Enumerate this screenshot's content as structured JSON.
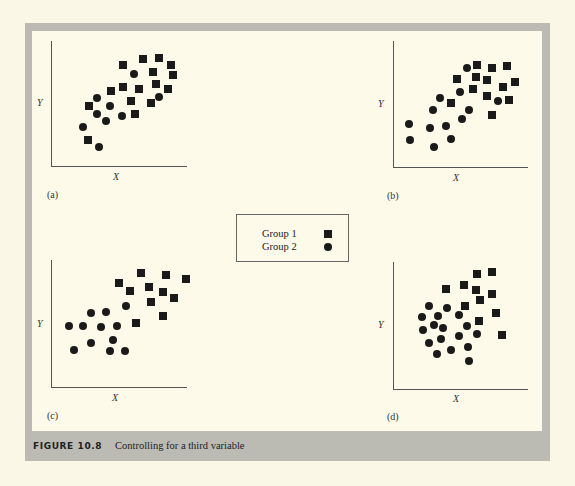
{
  "figure": {
    "label": "FIGURE 10.8",
    "caption": "Controlling for a third variable"
  },
  "legend": {
    "items": [
      {
        "label": "Group 1",
        "marker": "square"
      },
      {
        "label": "Group 2",
        "marker": "circle"
      }
    ]
  },
  "chart_data": [
    {
      "type": "scatter",
      "panel": "(a)",
      "xlabel": "X",
      "ylabel": "Y",
      "series": [
        {
          "name": "Group 1",
          "marker": "square",
          "points": [
            [
              123,
              65
            ],
            [
              143,
              59
            ],
            [
              159,
              58
            ],
            [
              171,
              65
            ],
            [
              153,
              72
            ],
            [
              173,
              75
            ],
            [
              111,
              91
            ],
            [
              123,
              87
            ],
            [
              139,
              89
            ],
            [
              156,
              84
            ],
            [
              168,
              89
            ],
            [
              89,
              106
            ],
            [
              131,
              101
            ],
            [
              151,
              103
            ],
            [
              135,
              114
            ],
            [
              88,
              140
            ]
          ]
        },
        {
          "name": "Group 2",
          "marker": "circle",
          "points": [
            [
              134,
              74
            ],
            [
              97,
              98
            ],
            [
              110,
              106
            ],
            [
              159,
              97
            ],
            [
              97,
              114
            ],
            [
              106,
              121
            ],
            [
              122,
              116
            ],
            [
              83,
              127
            ],
            [
              99,
              147
            ]
          ]
        }
      ]
    },
    {
      "type": "scatter",
      "panel": "(b)",
      "xlabel": "X",
      "ylabel": "Y",
      "series": [
        {
          "name": "Group 1",
          "marker": "square",
          "points": [
            [
              477,
              65
            ],
            [
              492,
              68
            ],
            [
              507,
              66
            ],
            [
              457,
              79
            ],
            [
              476,
              77
            ],
            [
              487,
              80
            ],
            [
              503,
              87
            ],
            [
              515,
              82
            ],
            [
              473,
              89
            ],
            [
              487,
              96
            ],
            [
              509,
              100
            ],
            [
              451,
              103
            ],
            [
              492,
              115
            ]
          ]
        },
        {
          "name": "Group 2",
          "marker": "circle",
          "points": [
            [
              467,
              68
            ],
            [
              460,
              92
            ],
            [
              440,
              98
            ],
            [
              498,
              101
            ],
            [
              433,
              110
            ],
            [
              469,
              110
            ],
            [
              462,
              119
            ],
            [
              409,
              124
            ],
            [
              430,
              128
            ],
            [
              446,
              126
            ],
            [
              410,
              140
            ],
            [
              451,
              139
            ],
            [
              434,
              147
            ]
          ]
        }
      ]
    },
    {
      "type": "scatter",
      "panel": "(c)",
      "xlabel": "X",
      "ylabel": "Y",
      "series": [
        {
          "name": "Group 1",
          "marker": "square",
          "points": [
            [
              141,
              273
            ],
            [
              166,
              275
            ],
            [
              186,
              279
            ],
            [
              119,
              283
            ],
            [
              149,
              287
            ],
            [
              130,
              291
            ],
            [
              163,
              292
            ],
            [
              174,
              298
            ],
            [
              151,
              302
            ],
            [
              163,
              316
            ],
            [
              136,
              323
            ]
          ]
        },
        {
          "name": "Group 2",
          "marker": "circle",
          "points": [
            [
              126,
              306
            ],
            [
              91,
              313
            ],
            [
              106,
              312
            ],
            [
              69,
              326
            ],
            [
              83,
              326
            ],
            [
              101,
              327
            ],
            [
              117,
              326
            ],
            [
              113,
              340
            ],
            [
              91,
              343
            ],
            [
              74,
              350
            ],
            [
              110,
              351
            ],
            [
              125,
              351
            ]
          ]
        }
      ]
    },
    {
      "type": "scatter",
      "panel": "(d)",
      "xlabel": "X",
      "ylabel": "Y",
      "series": [
        {
          "name": "Group 1",
          "marker": "square",
          "points": [
            [
              477,
              274
            ],
            [
              492,
              272
            ],
            [
              446,
              289
            ],
            [
              464,
              285
            ],
            [
              476,
              290
            ],
            [
              492,
              294
            ],
            [
              480,
              300
            ],
            [
              465,
              306
            ],
            [
              496,
              313
            ],
            [
              479,
              321
            ],
            [
              502,
              335
            ]
          ]
        },
        {
          "name": "Group 2",
          "marker": "circle",
          "points": [
            [
              429,
              306
            ],
            [
              447,
              308
            ],
            [
              422,
              317
            ],
            [
              438,
              316
            ],
            [
              459,
              315
            ],
            [
              434,
              325
            ],
            [
              443,
              328
            ],
            [
              467,
              326
            ],
            [
              423,
              330
            ],
            [
              459,
              336
            ],
            [
              477,
              334
            ],
            [
              441,
              339
            ],
            [
              429,
              343
            ],
            [
              451,
              350
            ],
            [
              468,
              347
            ],
            [
              437,
              354
            ],
            [
              469,
              361
            ]
          ]
        }
      ]
    }
  ],
  "panels": [
    {
      "id": "a",
      "label": "(a)",
      "x_label": "X",
      "y_label": "Y",
      "vaxis": {
        "x": 51,
        "y1": 41,
        "y2": 166
      },
      "haxis": {
        "y": 166,
        "x1": 51,
        "x2": 187
      },
      "ylabel_pos": [
        37,
        98
      ],
      "xlabel_pos": [
        113,
        172
      ],
      "panel_label_pos": [
        47,
        190
      ]
    },
    {
      "id": "b",
      "label": "(b)",
      "x_label": "X",
      "y_label": "Y",
      "vaxis": {
        "x": 393,
        "y1": 41,
        "y2": 167
      },
      "haxis": {
        "y": 167,
        "x1": 393,
        "x2": 528
      },
      "ylabel_pos": [
        378,
        99
      ],
      "xlabel_pos": [
        453,
        173
      ],
      "panel_label_pos": [
        387,
        191
      ]
    },
    {
      "id": "c",
      "label": "(c)",
      "x_label": "X",
      "y_label": "Y",
      "vaxis": {
        "x": 51,
        "y1": 260,
        "y2": 387
      },
      "haxis": {
        "y": 387,
        "x1": 51,
        "x2": 187
      },
      "ylabel_pos": [
        37,
        319
      ],
      "xlabel_pos": [
        112,
        393
      ],
      "panel_label_pos": [
        47,
        411
      ]
    },
    {
      "id": "d",
      "label": "(d)",
      "x_label": "X",
      "y_label": "Y",
      "vaxis": {
        "x": 393,
        "y1": 262,
        "y2": 389
      },
      "haxis": {
        "y": 389,
        "x1": 393,
        "x2": 528
      },
      "ylabel_pos": [
        378,
        320
      ],
      "xlabel_pos": [
        453,
        394
      ],
      "panel_label_pos": [
        387,
        412
      ]
    }
  ]
}
